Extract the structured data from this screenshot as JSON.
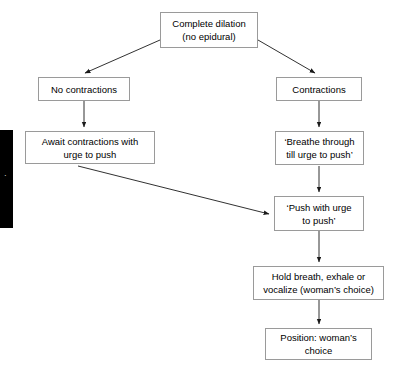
{
  "diagram": {
    "background_color": "#ffffff",
    "box_border_color": "#9a9a9a",
    "edge_color": "#1a1a1a",
    "nodes": [
      {
        "id": "complete-dilation",
        "label": "Complete dilation\n(no epidural)"
      },
      {
        "id": "no-contractions",
        "label": "No contractions"
      },
      {
        "id": "contractions",
        "label": "Contractions"
      },
      {
        "id": "await-contractions",
        "label": "Await contractions with\nurge to push"
      },
      {
        "id": "breathe-through",
        "label": "‘Breathe through\ntill urge to push’"
      },
      {
        "id": "push-with-urge",
        "label": "‘Push with urge\nto push’"
      },
      {
        "id": "hold-breath",
        "label": "Hold breath, exhale or\nvocalize (woman’s choice)"
      },
      {
        "id": "position-choice",
        "label": "Position: woman’s\nchoice"
      }
    ],
    "edges": [
      {
        "from": "complete-dilation",
        "to": "no-contractions"
      },
      {
        "from": "complete-dilation",
        "to": "contractions"
      },
      {
        "from": "no-contractions",
        "to": "await-contractions"
      },
      {
        "from": "contractions",
        "to": "breathe-through"
      },
      {
        "from": "await-contractions",
        "to": "push-with-urge"
      },
      {
        "from": "breathe-through",
        "to": "push-with-urge"
      },
      {
        "from": "push-with-urge",
        "to": "hold-breath"
      },
      {
        "from": "hold-breath",
        "to": "position-choice"
      }
    ],
    "side_marker": {
      "color": "#000000",
      "glyph": "·"
    }
  }
}
